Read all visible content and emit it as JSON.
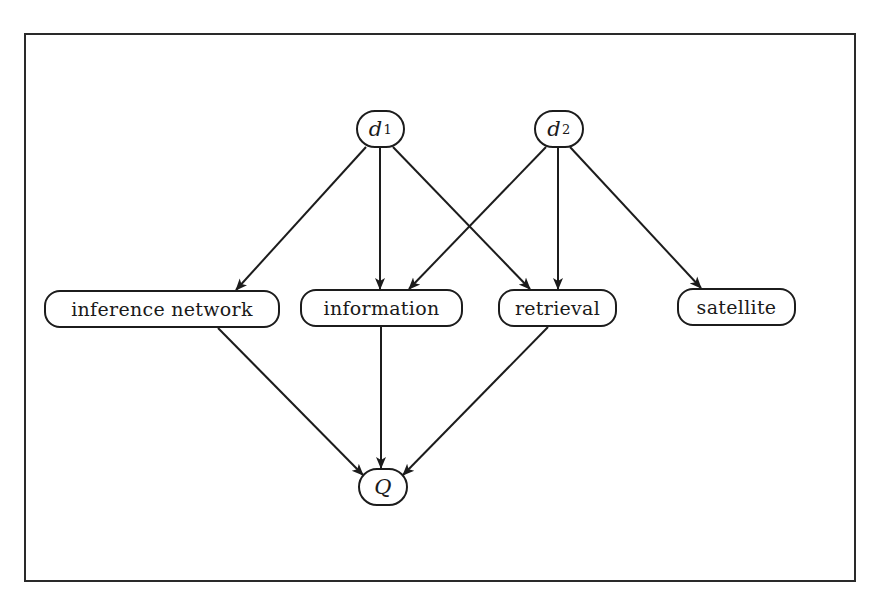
{
  "diagram": {
    "type": "inference-network",
    "frame": {
      "left": 24,
      "top": 33,
      "right": 856,
      "bottom": 582
    },
    "colors": {
      "stroke": "#1c1c1c",
      "background": "#ffffff",
      "text": "#1a1a1a"
    },
    "nodes": [
      {
        "id": "d1",
        "label": "d",
        "subscript": "1",
        "kind": "document",
        "x": 356,
        "y": 110,
        "w": 49,
        "h": 38
      },
      {
        "id": "d2",
        "label": "d",
        "subscript": "2",
        "kind": "document",
        "x": 534,
        "y": 110,
        "w": 50,
        "h": 38
      },
      {
        "id": "inference_network",
        "label": "inference network",
        "kind": "term",
        "x": 44,
        "y": 290,
        "w": 236,
        "h": 38
      },
      {
        "id": "information",
        "label": "information",
        "kind": "term",
        "x": 300,
        "y": 289,
        "w": 163,
        "h": 38
      },
      {
        "id": "retrieval",
        "label": "retrieval",
        "kind": "term",
        "x": 498,
        "y": 289,
        "w": 119,
        "h": 38
      },
      {
        "id": "satellite",
        "label": "satellite",
        "kind": "term",
        "x": 677,
        "y": 288,
        "w": 119,
        "h": 38
      },
      {
        "id": "Q",
        "label": "Q",
        "kind": "query",
        "x": 358,
        "y": 468,
        "w": 50,
        "h": 38
      }
    ],
    "edges": [
      {
        "from": "d1",
        "to": "inference_network",
        "x1": 366,
        "y1": 147,
        "x2": 236,
        "y2": 290
      },
      {
        "from": "d1",
        "to": "information",
        "x1": 380,
        "y1": 148,
        "x2": 380,
        "y2": 289
      },
      {
        "from": "d1",
        "to": "retrieval",
        "x1": 393,
        "y1": 147,
        "x2": 530,
        "y2": 289
      },
      {
        "from": "d2",
        "to": "information",
        "x1": 546,
        "y1": 147,
        "x2": 409,
        "y2": 289
      },
      {
        "from": "d2",
        "to": "retrieval",
        "x1": 558,
        "y1": 148,
        "x2": 558,
        "y2": 289
      },
      {
        "from": "d2",
        "to": "satellite",
        "x1": 570,
        "y1": 147,
        "x2": 701,
        "y2": 288
      },
      {
        "from": "inference_network",
        "to": "Q",
        "x1": 218,
        "y1": 328,
        "x2": 363,
        "y2": 475
      },
      {
        "from": "information",
        "to": "Q",
        "x1": 381,
        "y1": 327,
        "x2": 381,
        "y2": 468
      },
      {
        "from": "retrieval",
        "to": "Q",
        "x1": 548,
        "y1": 327,
        "x2": 403,
        "y2": 475
      }
    ]
  }
}
